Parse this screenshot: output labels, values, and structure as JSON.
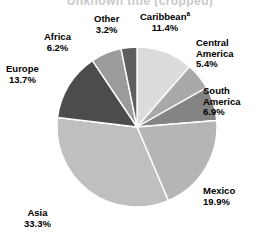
{
  "title": "Unknown title (cropped)",
  "chart_data": {
    "type": "pie",
    "title": "",
    "xlabel": "",
    "ylabel": "",
    "legend_position": "none",
    "grid": false,
    "start_angle_deg": 0,
    "direction": "clockwise",
    "units": "percent",
    "total": 100.0,
    "categories": [
      "Caribbean",
      "Central America",
      "South America",
      "Mexico",
      "Asia",
      "Europe",
      "Africa",
      "Other"
    ],
    "values": [
      11.4,
      5.4,
      6.9,
      19.9,
      33.3,
      13.7,
      6.2,
      3.2
    ],
    "slices": [
      {
        "label": "Caribbean",
        "label_line1": "Caribbean",
        "superscript": "a",
        "value": 11.4,
        "value_text": "11.4%",
        "color": "#dcdcdc"
      },
      {
        "label": "Central America",
        "label_line1": "Central",
        "label_line2": "America",
        "value": 5.4,
        "value_text": "5.4%",
        "color": "#a9a9a9"
      },
      {
        "label": "South America",
        "label_line1": "South",
        "label_line2": "America",
        "value": 6.9,
        "value_text": "6.9%",
        "color": "#848484"
      },
      {
        "label": "Mexico",
        "label_line1": "Mexico",
        "value": 19.9,
        "value_text": "19.9%",
        "color": "#b5b5b5"
      },
      {
        "label": "Asia",
        "label_line1": "Asia",
        "value": 33.3,
        "value_text": "33.3%",
        "color": "#bfbfbf"
      },
      {
        "label": "Europe",
        "label_line1": "Europe",
        "value": 13.7,
        "value_text": "13.7%",
        "color": "#4c4c4c"
      },
      {
        "label": "Africa",
        "label_line1": "Africa",
        "value": 6.2,
        "value_text": "6.2%",
        "color": "#9b9b9b"
      },
      {
        "label": "Other",
        "label_line1": "Other",
        "value": 3.2,
        "value_text": "3.2%",
        "color": "#5e5e5e"
      }
    ],
    "slice_separator_color": "#ffffff"
  }
}
